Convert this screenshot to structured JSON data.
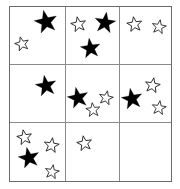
{
  "figure": {
    "grid": {
      "rows": 3,
      "cols": 3,
      "border_color": "#6b6b6b",
      "divider_color": "#8a8a8a",
      "background_color": "#ffffff"
    },
    "star_styles": {
      "filled_label": "filled-star",
      "filled_color": "#000000",
      "outline_label": "outline-star",
      "outline_stroke_color": "#1a1a1a",
      "outline_fill_color": "#ffffff"
    },
    "cells": [
      {
        "id": "cell-r1-c1",
        "row": 1,
        "col": 1,
        "filled_count": 1,
        "outline_count": 2,
        "total_count": 3,
        "stars": [
          {
            "type": "filled",
            "x": 46,
            "y": 22,
            "size": 24,
            "rotation": -12
          },
          {
            "type": "outline",
            "x": 22,
            "y": 44,
            "size": 16,
            "rotation": -14
          }
        ]
      },
      {
        "id": "cell-r1-c2",
        "row": 1,
        "col": 2,
        "filled_count": 2,
        "outline_count": 1,
        "total_count": 3,
        "stars": [
          {
            "type": "outline",
            "x": 78,
            "y": 24,
            "size": 17,
            "rotation": -10
          },
          {
            "type": "filled",
            "x": 105,
            "y": 23,
            "size": 22,
            "rotation": 8
          },
          {
            "type": "filled",
            "x": 90,
            "y": 48,
            "size": 21,
            "rotation": -8
          }
        ]
      },
      {
        "id": "cell-r1-c3",
        "row": 1,
        "col": 3,
        "filled_count": 0,
        "outline_count": 2,
        "total_count": 2,
        "stars": [
          {
            "type": "outline",
            "x": 134,
            "y": 24,
            "size": 17,
            "rotation": -8
          },
          {
            "type": "outline",
            "x": 159,
            "y": 27,
            "size": 16,
            "rotation": 10
          }
        ]
      },
      {
        "id": "cell-r2-c1",
        "row": 2,
        "col": 1,
        "filled_count": 1,
        "outline_count": 0,
        "total_count": 1,
        "stars": [
          {
            "type": "filled",
            "x": 46,
            "y": 86,
            "size": 22,
            "rotation": -10
          }
        ]
      },
      {
        "id": "cell-r2-c2",
        "row": 2,
        "col": 2,
        "filled_count": 1,
        "outline_count": 2,
        "total_count": 3,
        "stars": [
          {
            "type": "filled",
            "x": 78,
            "y": 98,
            "size": 22,
            "rotation": -12
          },
          {
            "type": "outline",
            "x": 106,
            "y": 98,
            "size": 16,
            "rotation": 12
          },
          {
            "type": "outline",
            "x": 93,
            "y": 110,
            "size": 16,
            "rotation": -6
          }
        ]
      },
      {
        "id": "cell-r2-c3",
        "row": 2,
        "col": 3,
        "filled_count": 1,
        "outline_count": 2,
        "total_count": 3,
        "stars": [
          {
            "type": "outline",
            "x": 152,
            "y": 85,
            "size": 17,
            "rotation": 10
          },
          {
            "type": "filled",
            "x": 132,
            "y": 99,
            "size": 22,
            "rotation": -10
          },
          {
            "type": "outline",
            "x": 159,
            "y": 108,
            "size": 16,
            "rotation": 8
          }
        ]
      },
      {
        "id": "cell-r3-c1",
        "row": 3,
        "col": 1,
        "filled_count": 1,
        "outline_count": 3,
        "total_count": 4,
        "stars": [
          {
            "type": "outline",
            "x": 24,
            "y": 137,
            "size": 17,
            "rotation": -10
          },
          {
            "type": "outline",
            "x": 51,
            "y": 145,
            "size": 17,
            "rotation": 8
          },
          {
            "type": "filled",
            "x": 29,
            "y": 158,
            "size": 22,
            "rotation": -12
          },
          {
            "type": "outline",
            "x": 52,
            "y": 172,
            "size": 16,
            "rotation": 10
          }
        ]
      },
      {
        "id": "cell-r3-c2",
        "row": 3,
        "col": 3,
        "filled_count": 0,
        "outline_count": 1,
        "total_count": 1,
        "stars": [
          {
            "type": "outline",
            "x": 84,
            "y": 143,
            "size": 17,
            "rotation": -10
          }
        ]
      },
      {
        "id": "cell-r3-c3",
        "row": 3,
        "col": 3,
        "filled_count": 0,
        "outline_count": 0,
        "total_count": 0,
        "stars": []
      }
    ],
    "totals": {
      "filled_stars": 7,
      "outline_stars": 13,
      "all_stars": 20
    }
  }
}
